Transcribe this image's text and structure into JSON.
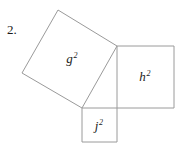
{
  "figure": {
    "problem_number": "2.",
    "background_color": "#ffffff",
    "stroke_color": "#9a9a9a",
    "text_color": "#1b1b1b",
    "width": 185,
    "height": 146,
    "shapes": [
      {
        "name": "square-g",
        "label_base": "g",
        "label_exponent": "2",
        "points": "58,10 117,46 82,108 22,73",
        "orientation": "tilted",
        "label_x": 72,
        "label_y": 58
      },
      {
        "name": "square-h",
        "label_base": "h",
        "label_exponent": "2",
        "points": "117,46 174,46 174,108 117,108",
        "orientation": "axis-aligned",
        "label_x": 145,
        "label_y": 76
      },
      {
        "name": "square-j",
        "label_base": "j",
        "label_exponent": "2",
        "points": "82,108 117,108 117,142 82,142",
        "orientation": "axis-aligned",
        "label_x": 99,
        "label_y": 125
      }
    ],
    "labels": {
      "g": {
        "base": "g",
        "exponent": "2"
      },
      "h": {
        "base": "h",
        "exponent": "2"
      },
      "j": {
        "base": "j",
        "exponent": "2"
      }
    }
  }
}
